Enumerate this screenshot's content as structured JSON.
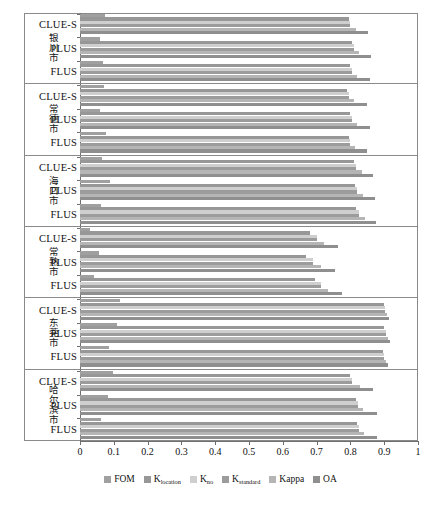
{
  "chart_data": {
    "type": "bar",
    "orientation": "horizontal",
    "title": "",
    "xlabel": "",
    "ylabel": "",
    "xlim": [
      0,
      1
    ],
    "xticks": [
      "0",
      "0.1",
      "0.2",
      "0.3",
      "0.4",
      "0.5",
      "0.6",
      "0.7",
      "0.8",
      "0.9",
      "1"
    ],
    "xtick_values": [
      0,
      0.1,
      0.2,
      0.3,
      0.4,
      0.5,
      0.6,
      0.7,
      0.8,
      0.9,
      1
    ],
    "grid": false,
    "legend_position": "bottom",
    "series": [
      {
        "name": "FOM",
        "label": "FOM",
        "color": "#a0a0a0"
      },
      {
        "name": "K_location",
        "label": "K",
        "sub": "location",
        "color": "#979797"
      },
      {
        "name": "K_no",
        "label": "K",
        "sub": "no",
        "color": "#cfcfcf"
      },
      {
        "name": "K_standard",
        "label": "K",
        "sub": "standard",
        "color": "#9c9c9c"
      },
      {
        "name": "Kappa",
        "label": "Kappa",
        "color": "#b5b5b5"
      },
      {
        "name": "OA",
        "label": "OA",
        "color": "#8f8f8f"
      }
    ],
    "groups": [
      {
        "label": "银川市",
        "models": [
          {
            "name": "CLUE-S",
            "values": [
              0.075,
              0.795,
              0.8,
              0.8,
              0.817,
              0.853
            ]
          },
          {
            "name": "PLUS",
            "values": [
              0.06,
              0.805,
              0.81,
              0.81,
              0.824,
              0.861
            ]
          },
          {
            "name": "FLUS",
            "values": [
              0.068,
              0.8,
              0.805,
              0.805,
              0.82,
              0.858
            ]
          }
        ]
      },
      {
        "label": "常德市",
        "models": [
          {
            "name": "CLUE-S",
            "values": [
              0.07,
              0.79,
              0.795,
              0.795,
              0.812,
              0.848
            ]
          },
          {
            "name": "PLUS",
            "values": [
              0.058,
              0.8,
              0.805,
              0.805,
              0.82,
              0.857
            ]
          },
          {
            "name": "FLUS",
            "values": [
              0.078,
              0.795,
              0.8,
              0.8,
              0.815,
              0.85
            ]
          }
        ]
      },
      {
        "label": "海口市",
        "models": [
          {
            "name": "CLUE-S",
            "values": [
              0.065,
              0.812,
              0.818,
              0.818,
              0.835,
              0.868
            ]
          },
          {
            "name": "PLUS",
            "values": [
              0.09,
              0.815,
              0.82,
              0.82,
              0.838,
              0.872
            ]
          },
          {
            "name": "FLUS",
            "values": [
              0.062,
              0.818,
              0.825,
              0.825,
              0.842,
              0.875
            ]
          }
        ]
      },
      {
        "label": "常熟市",
        "models": [
          {
            "name": "CLUE-S",
            "values": [
              0.03,
              0.68,
              0.7,
              0.7,
              0.722,
              0.762
            ]
          },
          {
            "name": "PLUS",
            "values": [
              0.055,
              0.668,
              0.69,
              0.69,
              0.712,
              0.755
            ]
          },
          {
            "name": "FLUS",
            "values": [
              0.042,
              0.695,
              0.712,
              0.712,
              0.735,
              0.775
            ]
          }
        ]
      },
      {
        "label": "东莞市",
        "models": [
          {
            "name": "CLUE-S",
            "values": [
              0.118,
              0.898,
              0.902,
              0.902,
              0.908,
              0.915
            ]
          },
          {
            "name": "PLUS",
            "values": [
              0.11,
              0.9,
              0.905,
              0.905,
              0.91,
              0.918
            ]
          },
          {
            "name": "FLUS",
            "values": [
              0.085,
              0.895,
              0.9,
              0.9,
              0.905,
              0.912
            ]
          }
        ]
      },
      {
        "label": "哈尔滨市",
        "models": [
          {
            "name": "CLUE-S",
            "values": [
              0.098,
              0.8,
              0.805,
              0.805,
              0.828,
              0.868
            ]
          },
          {
            "name": "PLUS",
            "values": [
              0.082,
              0.818,
              0.822,
              0.822,
              0.838,
              0.878
            ]
          },
          {
            "name": "FLUS",
            "values": [
              0.062,
              0.82,
              0.825,
              0.825,
              0.84,
              0.88
            ]
          }
        ]
      }
    ]
  }
}
